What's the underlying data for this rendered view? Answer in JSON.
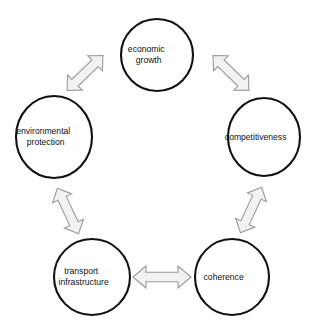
{
  "diagram": {
    "type": "cycle",
    "title": "",
    "background_color": "#ffffff",
    "node_fill_color": "#ffffff",
    "node_stroke_color": "#111111",
    "arrow_fill_color": "#f2f2f2",
    "arrow_stroke_color": "#9a9a9a",
    "label_color": "#101010",
    "nodes": [
      {
        "id": "economic-growth",
        "line1": "economic",
        "line2": "growth",
        "lines": 2,
        "cx": 157,
        "cy": 55,
        "rx": 36,
        "ry": 36
      },
      {
        "id": "competitiveness",
        "line1": "competitiveness",
        "line2": "",
        "lines": 1,
        "cx": 264,
        "cy": 137,
        "rx": 36,
        "ry": 39
      },
      {
        "id": "coherence",
        "line1": "coherence",
        "line2": "",
        "lines": 1,
        "cx": 232,
        "cy": 277,
        "rx": 37,
        "ry": 38
      },
      {
        "id": "transport-infrastructure",
        "line1": "transport",
        "line2": "infrastructure",
        "lines": 2,
        "cx": 92,
        "cy": 277,
        "rx": 38,
        "ry": 38
      },
      {
        "id": "environmental-protection",
        "line1": "environmental",
        "line2": "protection",
        "lines": 2,
        "cx": 54,
        "cy": 137,
        "rx": 38,
        "ry": 41
      }
    ],
    "connections": [
      {
        "id": "economic-growth--environmental-protection",
        "from": "economic growth",
        "to": "environmental protection",
        "direction": "bidirectional"
      },
      {
        "id": "economic-growth--competitiveness",
        "from": "economic growth",
        "to": "competitiveness",
        "direction": "bidirectional"
      },
      {
        "id": "competitiveness--coherence",
        "from": "competitiveness",
        "to": "coherence",
        "direction": "bidirectional"
      },
      {
        "id": "coherence--transport-infrastructure",
        "from": "coherence",
        "to": "transport infrastructure",
        "direction": "bidirectional"
      },
      {
        "id": "transport-infrastructure--environmental-protection",
        "from": "transport infrastructure",
        "to": "environmental protection",
        "direction": "bidirectional"
      }
    ]
  }
}
